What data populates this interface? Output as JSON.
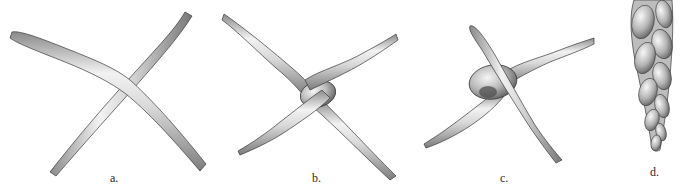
{
  "figure": {
    "panels": [
      {
        "id": "a",
        "label": "a.",
        "stage": "two strands crossing"
      },
      {
        "id": "b",
        "label": "b.",
        "stage": "strands looped into loose knot"
      },
      {
        "id": "c",
        "label": "c.",
        "stage": "knot tightened"
      },
      {
        "id": "d",
        "label": "d.",
        "stage": "braided tapering column"
      }
    ]
  },
  "colors": {
    "background": "#ffffff",
    "outline": "#3a3a3a",
    "highlight": "#f4f4f4",
    "midtone": "#bdbdbd",
    "shadow": "#7a7a7a",
    "label": "#2a2a2a"
  }
}
